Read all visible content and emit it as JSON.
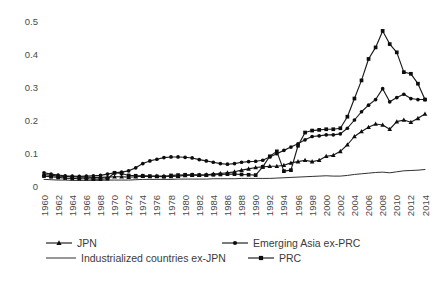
{
  "chart_data": {
    "type": "line",
    "title": "",
    "xlabel": "",
    "ylabel": "",
    "ylim": [
      0,
      0.5
    ],
    "xlim": [
      1960,
      2014
    ],
    "grid": false,
    "legend_position": "bottom",
    "ytick_labels": [
      "0",
      "0.1",
      "0.2",
      "0.3",
      "0.4",
      "0.5"
    ],
    "ytick_values": [
      0,
      0.1,
      0.2,
      0.3,
      0.4,
      0.5
    ],
    "xtick_labels": [
      "1960",
      "1962",
      "1964",
      "1966",
      "1968",
      "1970",
      "1972",
      "1974",
      "1976",
      "1978",
      "1980",
      "1982",
      "1984",
      "1986",
      "1988",
      "1990",
      "1992",
      "1994",
      "1996",
      "1998",
      "2000",
      "2002",
      "2004",
      "2006",
      "2008",
      "2010",
      "2012",
      "2014"
    ],
    "x": [
      1960,
      1961,
      1962,
      1963,
      1964,
      1965,
      1966,
      1967,
      1968,
      1969,
      1970,
      1971,
      1972,
      1973,
      1974,
      1975,
      1976,
      1977,
      1978,
      1979,
      1980,
      1981,
      1982,
      1983,
      1984,
      1985,
      1986,
      1987,
      1988,
      1989,
      1990,
      1991,
      1992,
      1993,
      1994,
      1995,
      1996,
      1997,
      1998,
      1999,
      2000,
      2001,
      2002,
      2003,
      2004,
      2005,
      2006,
      2007,
      2008,
      2009,
      2010,
      2011,
      2012,
      2013,
      2014
    ],
    "series": [
      {
        "name": "JPN",
        "marker": "triangle",
        "line_style": "solid",
        "color": "#0d0d0d",
        "values": [
          0.035,
          0.032,
          0.03,
          0.029,
          0.028,
          0.027,
          0.027,
          0.026,
          0.026,
          0.027,
          0.028,
          0.028,
          0.027,
          0.028,
          0.03,
          0.029,
          0.03,
          0.03,
          0.029,
          0.03,
          0.032,
          0.033,
          0.033,
          0.034,
          0.036,
          0.038,
          0.04,
          0.043,
          0.048,
          0.052,
          0.056,
          0.058,
          0.06,
          0.06,
          0.063,
          0.07,
          0.074,
          0.078,
          0.074,
          0.078,
          0.09,
          0.093,
          0.105,
          0.125,
          0.15,
          0.165,
          0.178,
          0.188,
          0.185,
          0.172,
          0.195,
          0.2,
          0.193,
          0.205,
          0.218
        ]
      },
      {
        "name": "Emerging Asia ex-PRC",
        "marker": "circle",
        "line_style": "solid",
        "color": "#0d0d0d",
        "values": [
          0.04,
          0.036,
          0.033,
          0.031,
          0.03,
          0.029,
          0.03,
          0.031,
          0.032,
          0.036,
          0.04,
          0.042,
          0.046,
          0.055,
          0.068,
          0.076,
          0.081,
          0.086,
          0.088,
          0.088,
          0.087,
          0.085,
          0.08,
          0.076,
          0.072,
          0.068,
          0.066,
          0.068,
          0.072,
          0.074,
          0.075,
          0.078,
          0.088,
          0.098,
          0.108,
          0.118,
          0.128,
          0.14,
          0.15,
          0.152,
          0.155,
          0.155,
          0.158,
          0.175,
          0.2,
          0.225,
          0.245,
          0.262,
          0.295,
          0.255,
          0.268,
          0.278,
          0.265,
          0.262,
          0.262
        ]
      },
      {
        "name": "Industrialized countries ex-JPN",
        "marker": "none",
        "line_style": "solid",
        "color": "#3b3b3b",
        "values": [
          0.02,
          0.019,
          0.018,
          0.018,
          0.017,
          0.017,
          0.017,
          0.017,
          0.017,
          0.018,
          0.018,
          0.018,
          0.018,
          0.019,
          0.02,
          0.02,
          0.02,
          0.02,
          0.02,
          0.021,
          0.021,
          0.021,
          0.021,
          0.021,
          0.022,
          0.022,
          0.022,
          0.022,
          0.023,
          0.023,
          0.023,
          0.023,
          0.023,
          0.024,
          0.025,
          0.026,
          0.027,
          0.028,
          0.029,
          0.03,
          0.031,
          0.03,
          0.03,
          0.032,
          0.035,
          0.037,
          0.039,
          0.041,
          0.042,
          0.04,
          0.043,
          0.046,
          0.047,
          0.048,
          0.05
        ]
      },
      {
        "name": "PRC",
        "marker": "square",
        "line_style": "solid",
        "color": "#0d0d0d",
        "values": [
          0.03,
          0.028,
          0.026,
          0.024,
          0.023,
          0.022,
          0.022,
          0.021,
          0.021,
          0.022,
          0.04,
          0.038,
          0.032,
          0.031,
          0.031,
          0.03,
          0.029,
          0.028,
          0.032,
          0.033,
          0.034,
          0.034,
          0.033,
          0.033,
          0.034,
          0.035,
          0.036,
          0.036,
          0.035,
          0.034,
          0.033,
          0.058,
          0.09,
          0.105,
          0.045,
          0.048,
          0.122,
          0.162,
          0.168,
          0.17,
          0.172,
          0.172,
          0.175,
          0.21,
          0.265,
          0.32,
          0.385,
          0.42,
          0.47,
          0.43,
          0.405,
          0.345,
          0.34,
          0.31,
          0.262
        ]
      }
    ]
  },
  "legend": {
    "items": [
      {
        "label": "JPN",
        "marker": "triangle"
      },
      {
        "label": "Emerging Asia ex-PRC",
        "marker": "circle"
      },
      {
        "label": "Industrialized countries ex-JPN",
        "marker": "none"
      },
      {
        "label": "PRC",
        "marker": "square"
      }
    ]
  }
}
